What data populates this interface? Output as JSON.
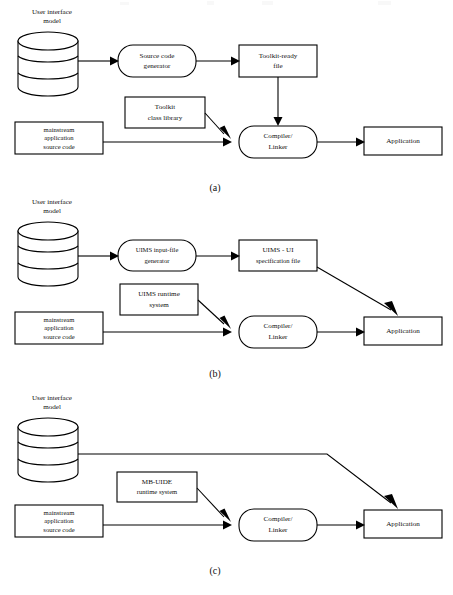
{
  "figure": {
    "background": "#ffffff",
    "stroke_color": "#000000",
    "width": 453,
    "height": 595
  },
  "panels": [
    {
      "id": "a",
      "caption": "(a)",
      "caption_x": 215,
      "caption_y": 191,
      "nodes": [
        {
          "name": "ui-model-cylinder",
          "kind": "cylinder",
          "label": "User interface\nmodel",
          "label_lines": [
            "User interface",
            "model"
          ],
          "x": 18,
          "y": 32,
          "w": 60,
          "h": 64,
          "label_x": 52,
          "label_y": 12
        },
        {
          "name": "source-code-generator",
          "kind": "rounded",
          "label_lines": [
            "Source code",
            "generator"
          ],
          "x": 118,
          "y": 45,
          "w": 78,
          "h": 32
        },
        {
          "name": "toolkit-ready-file",
          "kind": "rect",
          "label_lines": [
            "Toolkit-ready",
            "file"
          ],
          "x": 239,
          "y": 45,
          "w": 78,
          "h": 32
        },
        {
          "name": "toolkit-class-library",
          "kind": "rect",
          "label_lines": [
            "Toolkit",
            "class library"
          ],
          "x": 125,
          "y": 97,
          "w": 80,
          "h": 31
        },
        {
          "name": "mainstream-source-code",
          "kind": "rect",
          "label_lines": [
            "mainstream",
            "application",
            "source code"
          ],
          "x": 15,
          "y": 122,
          "w": 88,
          "h": 32
        },
        {
          "name": "compiler-linker",
          "kind": "rounded",
          "label_lines": [
            "Compiler/",
            "Linker"
          ],
          "x": 239,
          "y": 126,
          "w": 78,
          "h": 32
        },
        {
          "name": "application",
          "kind": "rect",
          "label_lines": [
            "Application"
          ],
          "x": 364,
          "y": 127,
          "w": 78,
          "h": 28
        }
      ],
      "edges": [
        {
          "name": "edge-model-to-generator",
          "from": "ui-model-cylinder",
          "to": "source-code-generator"
        },
        {
          "name": "edge-generator-to-toolkitfile",
          "from": "source-code-generator",
          "to": "toolkit-ready-file"
        },
        {
          "name": "edge-toolkitfile-to-compiler",
          "from": "toolkit-ready-file",
          "to": "compiler-linker"
        },
        {
          "name": "edge-library-to-compiler",
          "from": "toolkit-class-library",
          "to": "compiler-linker"
        },
        {
          "name": "edge-source-to-compiler",
          "from": "mainstream-source-code",
          "to": "compiler-linker"
        },
        {
          "name": "edge-compiler-to-application",
          "from": "compiler-linker",
          "to": "application"
        }
      ]
    },
    {
      "id": "b",
      "caption": "(b)",
      "caption_x": 215,
      "caption_y": 377,
      "nodes": [
        {
          "name": "ui-model-cylinder",
          "kind": "cylinder",
          "label_lines": [
            "User interface",
            "model"
          ],
          "x": 18,
          "y": 222,
          "w": 60,
          "h": 64,
          "label_x": 52,
          "label_y": 202
        },
        {
          "name": "uims-input-file-generator",
          "kind": "rounded",
          "label_lines": [
            "UIMS input-file",
            "generator"
          ],
          "x": 118,
          "y": 240,
          "w": 78,
          "h": 31
        },
        {
          "name": "uims-ui-specification-file",
          "kind": "rect",
          "label_lines": [
            "UIMS - UI",
            "specification file"
          ],
          "x": 239,
          "y": 240,
          "w": 78,
          "h": 31
        },
        {
          "name": "uims-runtime-system",
          "kind": "rect",
          "label_lines": [
            "UIMS runtime",
            "system"
          ],
          "x": 120,
          "y": 284,
          "w": 78,
          "h": 31
        },
        {
          "name": "mainstream-source-code",
          "kind": "rect",
          "label_lines": [
            "mainstream",
            "application",
            "source code"
          ],
          "x": 15,
          "y": 312,
          "w": 88,
          "h": 32
        },
        {
          "name": "compiler-linker",
          "kind": "rounded",
          "label_lines": [
            "Compiler/",
            "Linker"
          ],
          "x": 239,
          "y": 316,
          "w": 78,
          "h": 32
        },
        {
          "name": "application",
          "kind": "rect",
          "label_lines": [
            "Application"
          ],
          "x": 364,
          "y": 317,
          "w": 78,
          "h": 28
        }
      ],
      "edges": [
        {
          "name": "edge-model-to-generator",
          "from": "ui-model-cylinder",
          "to": "uims-input-file-generator"
        },
        {
          "name": "edge-generator-to-specfile",
          "from": "uims-input-file-generator",
          "to": "uims-ui-specification-file"
        },
        {
          "name": "edge-specfile-to-application",
          "from": "uims-ui-specification-file",
          "to": "application"
        },
        {
          "name": "edge-runtime-to-compiler",
          "from": "uims-runtime-system",
          "to": "compiler-linker"
        },
        {
          "name": "edge-source-to-compiler",
          "from": "mainstream-source-code",
          "to": "compiler-linker"
        },
        {
          "name": "edge-compiler-to-application",
          "from": "compiler-linker",
          "to": "application"
        }
      ]
    },
    {
      "id": "c",
      "caption": "(c)",
      "caption_x": 215,
      "caption_y": 574,
      "nodes": [
        {
          "name": "ui-model-cylinder",
          "kind": "cylinder",
          "label_lines": [
            "User interface",
            "model"
          ],
          "x": 18,
          "y": 418,
          "w": 60,
          "h": 64,
          "label_x": 52,
          "label_y": 398
        },
        {
          "name": "mbuide-runtime-system",
          "kind": "rect",
          "label_lines": [
            "MB-UIDE",
            "runtime system"
          ],
          "x": 117,
          "y": 472,
          "w": 80,
          "h": 30
        },
        {
          "name": "mainstream-source-code",
          "kind": "rect",
          "label_lines": [
            "mainstream",
            "application",
            "source code"
          ],
          "x": 15,
          "y": 505,
          "w": 88,
          "h": 32
        },
        {
          "name": "compiler-linker",
          "kind": "rounded",
          "label_lines": [
            "Compiler/",
            "Linker"
          ],
          "x": 239,
          "y": 509,
          "w": 78,
          "h": 32
        },
        {
          "name": "application",
          "kind": "rect",
          "label_lines": [
            "Application"
          ],
          "x": 364,
          "y": 510,
          "w": 78,
          "h": 28
        }
      ],
      "edges": [
        {
          "name": "edge-model-to-application",
          "from": "ui-model-cylinder",
          "to": "application"
        },
        {
          "name": "edge-runtime-to-compiler",
          "from": "mbuide-runtime-system",
          "to": "compiler-linker"
        },
        {
          "name": "edge-source-to-compiler",
          "from": "mainstream-source-code",
          "to": "compiler-linker"
        },
        {
          "name": "edge-compiler-to-application",
          "from": "compiler-linker",
          "to": "application"
        }
      ]
    }
  ],
  "text": {
    "ui_model_l1": "User interface",
    "ui_model_l2": "model",
    "source_code_generator_l1": "Source code",
    "source_code_generator_l2": "generator",
    "toolkit_ready_file_l1": "Toolkit-ready",
    "toolkit_ready_file_l2": "file",
    "toolkit_class_library_l1": "Toolkit",
    "toolkit_class_library_l2": "class library",
    "mainstream_l1": "mainstream",
    "mainstream_l2": "application",
    "mainstream_l3": "source code",
    "compiler_linker_l1": "Compiler/",
    "compiler_linker_l2": "Linker",
    "application": "Application",
    "uims_generator_l1": "UIMS input-file",
    "uims_generator_l2": "generator",
    "uims_spec_l1": "UIMS - UI",
    "uims_spec_l2": "specification file",
    "uims_runtime_l1": "UIMS runtime",
    "uims_runtime_l2": "system",
    "mbuide_l1": "MB-UIDE",
    "mbuide_l2": "runtime system",
    "caption_a": "(a)",
    "caption_b": "(b)",
    "caption_c": "(c)"
  }
}
